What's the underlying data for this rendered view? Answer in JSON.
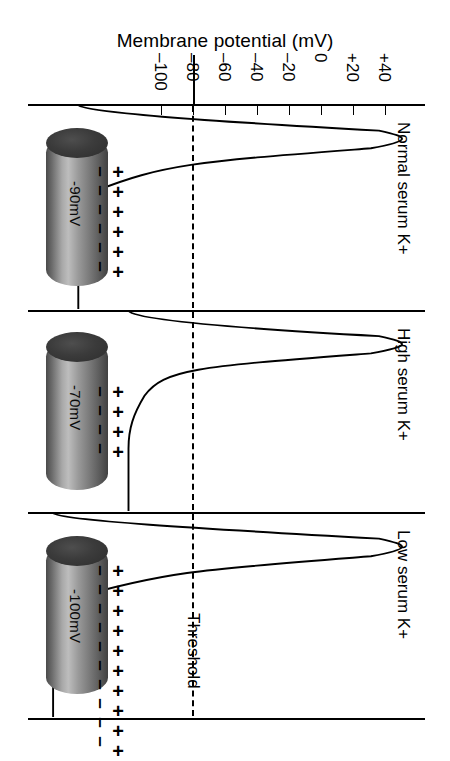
{
  "figure": {
    "title": "Membrane potential (mV)",
    "width": 450,
    "height": 761,
    "background": "#ffffff",
    "ink_color": "#000000"
  },
  "axis": {
    "name": "membrane-potential-axis",
    "unit": "mV",
    "tick_labels": [
      "–100",
      "–80",
      "–60",
      "–40",
      "–20",
      "0",
      "+20",
      "+40"
    ],
    "tick_values": [
      -100,
      -80,
      -60,
      -40,
      -20,
      0,
      20,
      40
    ],
    "tick_x_px": [
      161,
      193,
      225,
      257,
      289,
      321,
      353,
      385
    ],
    "min": -110,
    "max": 48,
    "orientation": "horizontal-top",
    "zero_axis_value": -80
  },
  "threshold": {
    "label": "Threshold",
    "value_mv": -55,
    "x_px": 192,
    "style": "dashed"
  },
  "panels": [
    {
      "id": "normal",
      "label": "Normal serum K+",
      "resting_potential": "-90mV",
      "resting_mv": -90,
      "charge_pairs": 6,
      "peak_mv": 40,
      "reaches_threshold": true
    },
    {
      "id": "high",
      "label": "High serum K+",
      "resting_potential": "-70mV",
      "resting_mv": -70,
      "charge_pairs": 4,
      "peak_mv": 40,
      "reaches_threshold": true
    },
    {
      "id": "low",
      "label": "Low serum K+",
      "resting_potential": "-100mV",
      "resting_mv": -100,
      "charge_pairs": 10,
      "peak_mv": 40,
      "reaches_threshold": true
    }
  ],
  "symbols": {
    "minus": "–",
    "plus": "+"
  },
  "chart_data": {
    "type": "line",
    "title": "Membrane potential (mV)",
    "xlabel": "Membrane potential (mV)",
    "ylabel": "",
    "orientation": "rotated-90",
    "xlim": [
      -110,
      48
    ],
    "grid": false,
    "legend": "none",
    "tick_labels": [
      "–100",
      "–80",
      "–60",
      "–40",
      "–20",
      "0",
      "+20",
      "+40"
    ],
    "annotations": [
      "Threshold"
    ],
    "series": [
      {
        "name": "Normal serum K+",
        "resting_mv": -90,
        "threshold_mv": -55,
        "peak_mv": 40,
        "values": [
          -90,
          -90,
          -90,
          -88,
          -80,
          -55,
          0,
          30,
          40,
          38,
          10,
          -40,
          -70,
          -85,
          -90
        ]
      },
      {
        "name": "High serum K+",
        "resting_mv": -70,
        "threshold_mv": -55,
        "peak_mv": 40,
        "values": [
          -70,
          -70,
          -70,
          -68,
          -62,
          -55,
          0,
          30,
          40,
          38,
          10,
          -40,
          -66,
          -70,
          -70
        ]
      },
      {
        "name": "Low serum K+",
        "resting_mv": -100,
        "threshold_mv": -55,
        "peak_mv": 40,
        "values": [
          -100,
          -100,
          -100,
          -98,
          -88,
          -55,
          0,
          30,
          40,
          38,
          10,
          -40,
          -80,
          -96,
          -100
        ]
      }
    ]
  }
}
